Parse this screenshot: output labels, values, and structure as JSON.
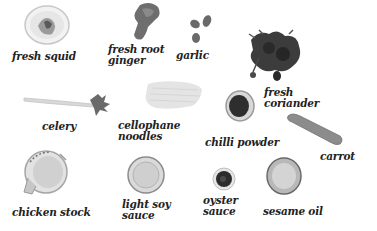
{
  "ingredients": [
    {
      "id": "squid",
      "label_line1": "fresh squid",
      "label_line2": ""
    },
    {
      "id": "ginger",
      "label_line1": "fresh root",
      "label_line2": "ginger"
    },
    {
      "id": "garlic",
      "label_line1": "garlic",
      "label_line2": ""
    },
    {
      "id": "coriander",
      "label_line1": "fresh",
      "label_line2": "coriander"
    },
    {
      "id": "celery",
      "label_line1": "celery",
      "label_line2": ""
    },
    {
      "id": "noodles",
      "label_line1": "cellophane",
      "label_line2": "noodles"
    },
    {
      "id": "chilli",
      "label_line1": "chilli powder",
      "label_line2": ""
    },
    {
      "id": "carrot",
      "label_line1": "carrot",
      "label_line2": ""
    },
    {
      "id": "stock",
      "label_line1": "chicken stock",
      "label_line2": ""
    },
    {
      "id": "soy",
      "label_line1": "light soy",
      "label_line2": "sauce"
    },
    {
      "id": "oyster",
      "label_line1": "oyster",
      "label_line2": "sauce"
    },
    {
      "id": "sesame",
      "label_line1": "sesame oil",
      "label_line2": ""
    }
  ],
  "colors": {
    "background": "#ffffff",
    "text": "#222222"
  }
}
